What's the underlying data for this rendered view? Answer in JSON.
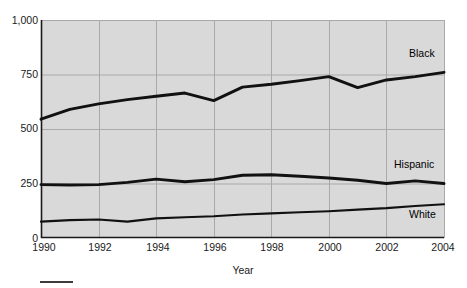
{
  "figure": {
    "clipped_title": "",
    "background_color": "#ffffff",
    "plot_background_color": "#d9d9d9",
    "gridline_color": "#a9a9a9",
    "axis_color": "#1a1a1a",
    "line_color": "#111111"
  },
  "axis": {
    "x_title": "Year",
    "y_ticklabels": [
      "1,000",
      "750",
      "500",
      "250",
      "0"
    ],
    "x_ticklabels": [
      "1990",
      "1992",
      "1994",
      "1996",
      "1998",
      "2000",
      "2002",
      "2004"
    ]
  },
  "series_labels": {
    "black": "Black",
    "hispanic": "Hispanic",
    "white": "White"
  },
  "chart_data": {
    "type": "line",
    "title": "",
    "xlabel": "Year",
    "ylabel": "",
    "xlim": [
      1990,
      2004
    ],
    "ylim": [
      0,
      1000
    ],
    "yticks": [
      0,
      250,
      500,
      750,
      1000
    ],
    "xticks": [
      1990,
      1992,
      1994,
      1996,
      1998,
      2000,
      2002,
      2004
    ],
    "grid": true,
    "legend": "inline-right",
    "x": [
      1990,
      1991,
      1992,
      1993,
      1994,
      1995,
      1996,
      1997,
      1998,
      1999,
      2000,
      2001,
      2002,
      2003,
      2004
    ],
    "series": [
      {
        "name": "Black",
        "label_position": "upper-right",
        "values": [
          545,
          590,
          615,
          635,
          650,
          665,
          630,
          692,
          705,
          722,
          740,
          690,
          725,
          740,
          760
        ]
      },
      {
        "name": "Hispanic",
        "label_position": "middle-right",
        "values": [
          245,
          243,
          245,
          255,
          270,
          258,
          268,
          288,
          290,
          283,
          275,
          265,
          250,
          262,
          250
        ]
      },
      {
        "name": "White",
        "label_position": "lower-right",
        "values": [
          75,
          82,
          85,
          75,
          90,
          95,
          100,
          108,
          113,
          118,
          123,
          130,
          137,
          147,
          155
        ]
      }
    ]
  }
}
